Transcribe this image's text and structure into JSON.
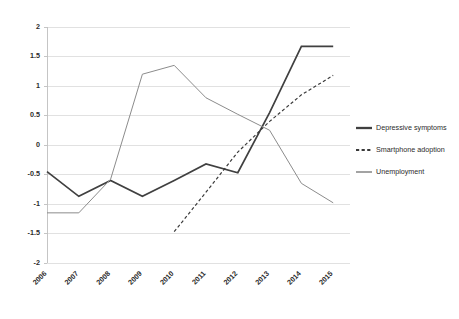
{
  "chart_data": {
    "type": "line",
    "title": "",
    "subtitle": "",
    "xlabel": "",
    "ylabel": "",
    "categories": [
      "2006",
      "2007",
      "2008",
      "2009",
      "2010",
      "2011",
      "2012",
      "2013",
      "2014",
      "2015"
    ],
    "ylim": [
      -2,
      2
    ],
    "ytick_labels": [
      "2",
      "1.5",
      "1",
      "0.5",
      "0",
      "-0.5",
      "-1",
      "-1.5",
      "-2"
    ],
    "ytick_values": [
      2,
      1.5,
      1,
      0.5,
      0,
      -0.5,
      -1,
      -1.5,
      -2
    ],
    "grid": "horizontal",
    "legend_position": "right",
    "series": [
      {
        "name": "Depressive symptoms",
        "style": "solid",
        "color": "#404040",
        "width": 1.7,
        "values": [
          -0.45,
          -0.87,
          -0.6,
          -0.87,
          -0.6,
          -0.32,
          -0.47,
          0.55,
          1.67,
          1.67
        ]
      },
      {
        "name": "Smartphone adoption",
        "style": "dashed",
        "color": "#3a3a3a",
        "width": 1.2,
        "values": [
          null,
          null,
          null,
          null,
          -1.47,
          -0.8,
          -0.12,
          0.4,
          0.85,
          1.18
        ]
      },
      {
        "name": "Unemployment",
        "style": "solid",
        "color": "#8c8c8c",
        "width": 1.0,
        "values": [
          -1.15,
          -1.15,
          -0.58,
          1.2,
          1.35,
          0.8,
          0.52,
          0.25,
          -0.65,
          -0.98
        ]
      }
    ]
  },
  "legend": {
    "items": [
      {
        "label": "Depressive symptoms",
        "swatch": "solid-thick-dark-line-icon"
      },
      {
        "label": "Smartphone adoption",
        "swatch": "dashed-dark-line-icon"
      },
      {
        "label": "Unemployment",
        "swatch": "solid-thin-gray-line-icon"
      }
    ]
  },
  "axes": {
    "y": {
      "labels": [
        "2",
        "1.5",
        "1",
        "0.5",
        "0",
        "-0.5",
        "-1",
        "-1.5",
        "-2"
      ]
    },
    "x": {
      "labels": [
        "2006",
        "2007",
        "2008",
        "2009",
        "2010",
        "2011",
        "2012",
        "2013",
        "2014",
        "2015"
      ]
    }
  },
  "colors": {
    "grid": "#d9d9d9",
    "axis": "#bfbfbf",
    "depressive": "#404040",
    "smartphone": "#3a3a3a",
    "unemployment": "#8c8c8c",
    "text": "#2b2b2b",
    "background": "#ffffff"
  }
}
